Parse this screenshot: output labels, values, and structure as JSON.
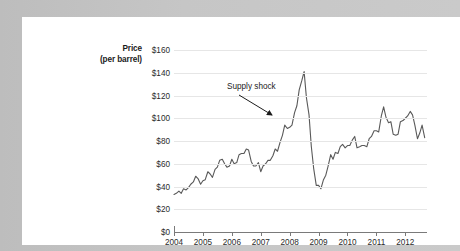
{
  "card": {
    "background_color": "#ffffff",
    "page_background_color": "#c6c6c6"
  },
  "chart_data": {
    "type": "line",
    "title": "",
    "subtitle": "",
    "xlabel": "",
    "ylabel": "Price (per barrel)",
    "ylabel_line1": "Price",
    "ylabel_line2": "(per barrel)",
    "ylim": [
      0,
      160
    ],
    "xlim": [
      2004,
      2012.75
    ],
    "grid": true,
    "legend": "none",
    "series_color": "#595959",
    "gridline_color": "#e6e6e6",
    "axis_color": "#7a7a7a",
    "y_ticks": [
      0,
      20,
      40,
      60,
      80,
      100,
      120,
      140,
      160
    ],
    "y_tick_labels": [
      "$0",
      "$20",
      "$40",
      "$60",
      "$80",
      "$100",
      "$120",
      "$140",
      "$160"
    ],
    "x_ticks": [
      2004,
      2005,
      2006,
      2007,
      2008,
      2009,
      2010,
      2011,
      2012
    ],
    "x_tick_labels": [
      "2004",
      "2005",
      "2006",
      "2007",
      "2008",
      "2009",
      "2010",
      "2011",
      "2012"
    ],
    "annotations": [
      {
        "text": "Supply shock",
        "points_to_x": 2008.25,
        "points_to_y": 107
      }
    ],
    "series": [
      {
        "name": "Crude oil price per barrel",
        "x": [
          2004.0,
          2004.08,
          2004.17,
          2004.25,
          2004.33,
          2004.42,
          2004.5,
          2004.58,
          2004.67,
          2004.75,
          2004.83,
          2004.92,
          2005.0,
          2005.08,
          2005.17,
          2005.25,
          2005.33,
          2005.42,
          2005.5,
          2005.58,
          2005.67,
          2005.75,
          2005.83,
          2005.92,
          2006.0,
          2006.08,
          2006.17,
          2006.25,
          2006.33,
          2006.42,
          2006.5,
          2006.58,
          2006.67,
          2006.75,
          2006.83,
          2006.92,
          2007.0,
          2007.08,
          2007.17,
          2007.25,
          2007.33,
          2007.42,
          2007.5,
          2007.58,
          2007.67,
          2007.75,
          2007.83,
          2007.92,
          2008.0,
          2008.08,
          2008.17,
          2008.25,
          2008.33,
          2008.42,
          2008.5,
          2008.58,
          2008.67,
          2008.75,
          2008.83,
          2008.92,
          2009.0,
          2009.08,
          2009.17,
          2009.25,
          2009.33,
          2009.42,
          2009.5,
          2009.58,
          2009.67,
          2009.75,
          2009.83,
          2009.92,
          2010.0,
          2010.08,
          2010.17,
          2010.25,
          2010.33,
          2010.42,
          2010.5,
          2010.58,
          2010.67,
          2010.75,
          2010.83,
          2010.92,
          2011.0,
          2011.08,
          2011.17,
          2011.25,
          2011.33,
          2011.42,
          2011.5,
          2011.58,
          2011.67,
          2011.75,
          2011.83,
          2011.92,
          2012.0,
          2012.08,
          2012.17,
          2012.25,
          2012.33,
          2012.42,
          2012.5,
          2012.58,
          2012.67
        ],
        "values": [
          33,
          34,
          36,
          34,
          38,
          37,
          39,
          42,
          44,
          49,
          47,
          42,
          45,
          46,
          53,
          51,
          48,
          55,
          57,
          63,
          64,
          60,
          57,
          58,
          64,
          60,
          61,
          68,
          69,
          69,
          73,
          72,
          62,
          58,
          58,
          61,
          53,
          58,
          60,
          63,
          63,
          67,
          73,
          71,
          79,
          85,
          94,
          91,
          92,
          94,
          105,
          111,
          125,
          133,
          141,
          118,
          103,
          75,
          56,
          41,
          41,
          38,
          46,
          50,
          58,
          68,
          64,
          70,
          69,
          75,
          77,
          74,
          76,
          76,
          81,
          84,
          74,
          75,
          76,
          76,
          75,
          82,
          84,
          89,
          89,
          88,
          102,
          110,
          101,
          96,
          97,
          86,
          85,
          86,
          97,
          98,
          100,
          102,
          106,
          103,
          94,
          82,
          87,
          94,
          83
        ]
      }
    ]
  }
}
